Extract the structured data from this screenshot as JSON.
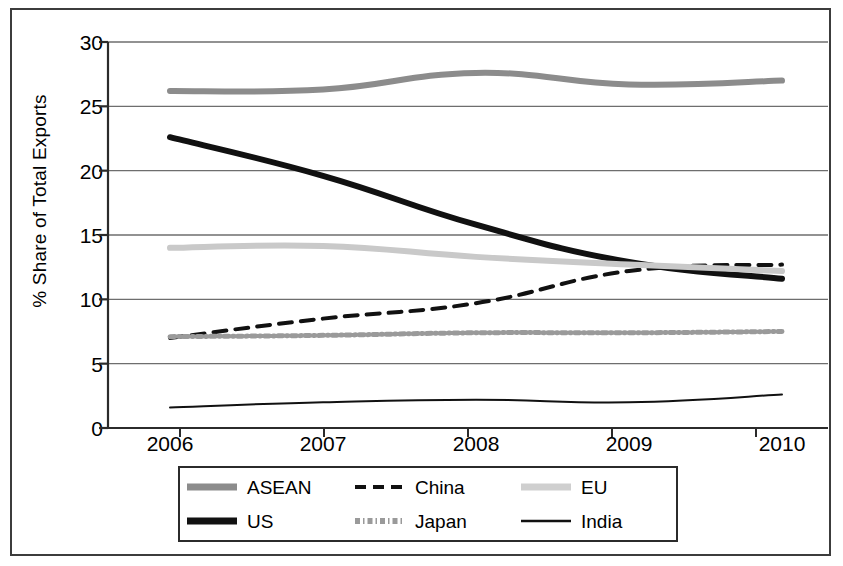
{
  "chart_data": {
    "type": "line",
    "title": "",
    "subtitle": "",
    "xlabel": "",
    "ylabel": "% Share of Total Exports",
    "categories": [
      "2006",
      "2007",
      "2008",
      "2009",
      "2010"
    ],
    "x_tick_labels": [
      "2006",
      "2007",
      "2008",
      "2009",
      "2010"
    ],
    "y_tick_labels": [
      "0",
      "5",
      "10",
      "15",
      "20",
      "25",
      "30"
    ],
    "y_ticks": [
      0,
      5,
      10,
      15,
      20,
      25,
      30
    ],
    "ylim": [
      0,
      30
    ],
    "grid": "horizontal",
    "legend_position": "bottom",
    "series": [
      {
        "name": "ASEAN",
        "values": [
          26.2,
          26.3,
          27.6,
          26.7,
          27.0
        ],
        "color": "#8c8c8c",
        "style": "solid-thick",
        "width": 6
      },
      {
        "name": "US",
        "values": [
          22.6,
          19.6,
          15.8,
          12.9,
          11.6
        ],
        "color": "#111111",
        "style": "solid-thick",
        "width": 6
      },
      {
        "name": "China",
        "values": [
          7.0,
          8.5,
          9.7,
          12.2,
          12.7
        ],
        "color": "#111111",
        "style": "dashed",
        "width": 4
      },
      {
        "name": "Japan",
        "values": [
          7.1,
          7.2,
          7.4,
          7.4,
          7.5
        ],
        "color": "#9a9a9a",
        "style": "dotted",
        "width": 5
      },
      {
        "name": "EU",
        "values": [
          14.0,
          14.15,
          13.3,
          12.7,
          12.2
        ],
        "color": "#c9c9c9",
        "style": "solid-thick",
        "width": 6
      },
      {
        "name": "India",
        "values": [
          1.6,
          2.0,
          2.2,
          2.0,
          2.6
        ],
        "color": "#111111",
        "style": "solid-thin",
        "width": 2
      }
    ]
  },
  "axis": {
    "y_label": "% Share of Total Exports",
    "y_ticks": [
      "30",
      "25",
      "20",
      "15",
      "10",
      "5",
      "0"
    ],
    "x_ticks": [
      "2006",
      "2007",
      "2008",
      "2009",
      "2010"
    ]
  },
  "legend": {
    "items": [
      {
        "label": "ASEAN",
        "icon": "line-swatch-thick-gray"
      },
      {
        "label": "China",
        "icon": "line-swatch-dashed-black"
      },
      {
        "label": "EU",
        "icon": "line-swatch-thick-lightgray"
      },
      {
        "label": "US",
        "icon": "line-swatch-thick-black"
      },
      {
        "label": "Japan",
        "icon": "line-swatch-dotted-gray"
      },
      {
        "label": "India",
        "icon": "line-swatch-thin-black"
      }
    ]
  },
  "colors": {
    "asean": "#8c8c8c",
    "us": "#111111",
    "china": "#111111",
    "japan": "#9a9a9a",
    "eu": "#c9c9c9",
    "india": "#111111",
    "grid": "#6e6e6e",
    "axis": "#2b2b2b",
    "frame": "#3c3c3c"
  }
}
